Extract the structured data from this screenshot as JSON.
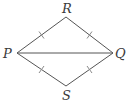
{
  "diagram": {
    "type": "geometry",
    "colors": {
      "line": "#555555",
      "tick": "#888888",
      "label": "#3a3a3a",
      "background": "#ffffff"
    },
    "vertices": {
      "R": {
        "label": "R",
        "x": 66,
        "y": 17
      },
      "P": {
        "label": "P",
        "x": 17,
        "y": 53
      },
      "Q": {
        "label": "Q",
        "x": 113,
        "y": 53
      },
      "S": {
        "label": "S",
        "x": 66,
        "y": 86
      }
    },
    "edges": [
      {
        "from": "P",
        "to": "R",
        "tick_marks": 1
      },
      {
        "from": "R",
        "to": "Q",
        "tick_marks": 1
      },
      {
        "from": "Q",
        "to": "S",
        "tick_marks": 1
      },
      {
        "from": "S",
        "to": "P",
        "tick_marks": 1
      },
      {
        "from": "P",
        "to": "Q",
        "tick_marks": 0
      }
    ]
  }
}
